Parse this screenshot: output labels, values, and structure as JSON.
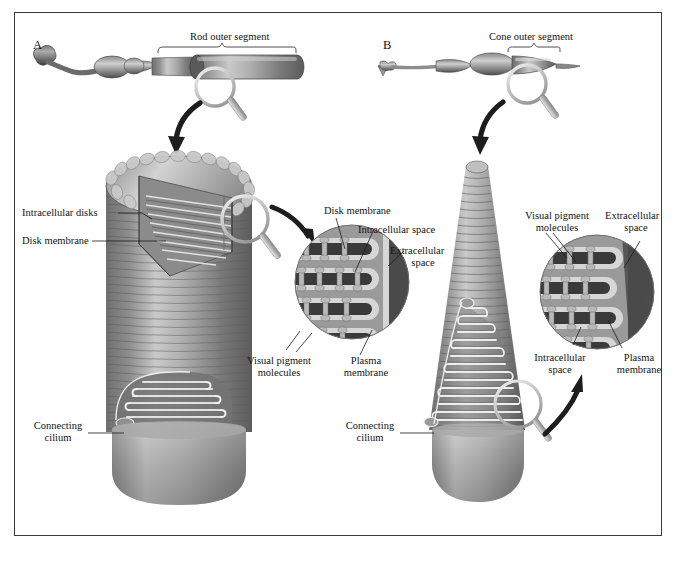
{
  "figure": {
    "panels": [
      {
        "letter": "A",
        "type": "rod"
      },
      {
        "letter": "B",
        "type": "cone"
      }
    ]
  },
  "panel_a": {
    "letter": "A",
    "bracket_label": "Rod outer segment",
    "labels": {
      "intracellular_disks": "Intracellular disks",
      "disk_membrane": "Disk membrane",
      "connecting_cilium_line1": "Connecting",
      "connecting_cilium_line2": "cilium"
    }
  },
  "panel_b": {
    "letter": "B",
    "bracket_label": "Cone outer segment",
    "labels": {
      "connecting_cilium_line1": "Connecting",
      "connecting_cilium_line2": "cilium"
    }
  },
  "inset_rod": {
    "disk_membrane": "Disk membrane",
    "intracellular_space": "Intracellular space",
    "extracellular_space_line1": "Extracellular",
    "extracellular_space_line2": "space",
    "visual_pigment_line1": "Visual pigment",
    "visual_pigment_line2": "molecules",
    "plasma_membrane_line1": "Plasma",
    "plasma_membrane_line2": "membrane"
  },
  "inset_cone": {
    "visual_pigment_line1": "Visual pigment",
    "visual_pigment_line2": "molecules",
    "extracellular_space_line1": "Extracellular",
    "extracellular_space_line2": "space",
    "intracellular_space_line1": "Intracellular",
    "intracellular_space_line2": "space",
    "plasma_membrane_line1": "Plasma",
    "plasma_membrane_line2": "membrane"
  },
  "colors": {
    "frame": "#3a3a3a",
    "text": "#141414",
    "cell_dark": "#4a4a4a",
    "cell_mid": "#9a9a9a",
    "cell_light": "#d8d8d8",
    "inset_dark": "#3b3b3b",
    "inset_membrane": "#cfcfcf",
    "inset_bg": "#8e8e8e",
    "arrow": "#111111"
  }
}
